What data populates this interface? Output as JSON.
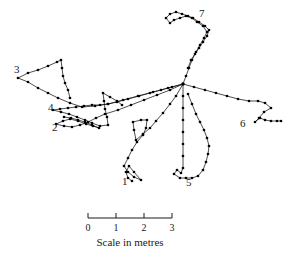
{
  "figure": {
    "background_color": "#ffffff",
    "line_color": "#111111",
    "node_color": "#000000",
    "hub": {
      "label": "central-nest-hub",
      "x": 183,
      "y": 84
    }
  },
  "scale_bar": {
    "caption": "Scale in metres",
    "ticks": [
      {
        "label": "0",
        "x": 88
      },
      {
        "label": "1",
        "x": 116
      },
      {
        "label": "2",
        "x": 144
      },
      {
        "label": "3",
        "x": 172
      }
    ],
    "bar_y": 218,
    "tick_height": 5,
    "numbers_y": 231,
    "caption_y": 246,
    "unit": "metres",
    "length_units": 3
  },
  "branches": [
    {
      "id": "1",
      "label": "1",
      "label_x": 122,
      "label_y": 185,
      "points": [
        [
          183,
          84
        ],
        [
          176,
          96
        ],
        [
          170,
          104
        ],
        [
          163,
          113
        ],
        [
          156,
          121
        ],
        [
          150,
          128
        ],
        [
          143,
          134
        ],
        [
          136,
          140
        ],
        [
          134,
          130
        ],
        [
          133,
          122
        ],
        [
          141,
          120
        ],
        [
          147,
          120
        ],
        [
          146,
          128
        ],
        [
          143,
          135
        ],
        [
          137,
          142
        ],
        [
          132,
          150
        ],
        [
          128,
          158
        ],
        [
          124,
          166
        ],
        [
          128,
          172
        ],
        [
          134,
          177
        ],
        [
          141,
          180
        ],
        [
          134,
          172
        ],
        [
          129,
          166
        ],
        [
          126,
          172
        ],
        [
          128,
          178
        ],
        [
          132,
          181
        ]
      ]
    },
    {
      "id": "2",
      "label": "2",
      "label_x": 52,
      "label_y": 131,
      "points": [
        [
          183,
          84
        ],
        [
          170,
          90
        ],
        [
          157,
          95
        ],
        [
          144,
          100
        ],
        [
          131,
          105
        ],
        [
          118,
          110
        ],
        [
          105,
          114
        ],
        [
          96,
          118
        ],
        [
          88,
          122
        ],
        [
          80,
          125
        ],
        [
          72,
          127
        ],
        [
          64,
          126
        ],
        [
          56,
          124
        ],
        [
          63,
          121
        ],
        [
          70,
          119
        ],
        [
          78,
          121
        ],
        [
          86,
          124
        ],
        [
          93,
          126
        ],
        [
          99,
          128
        ],
        [
          92,
          125
        ],
        [
          85,
          122
        ],
        [
          78,
          120
        ],
        [
          71,
          118
        ],
        [
          64,
          117
        ]
      ]
    },
    {
      "id": "3",
      "label": "3",
      "label_x": 14,
      "label_y": 73,
      "points": [
        [
          183,
          84
        ],
        [
          168,
          88
        ],
        [
          153,
          92
        ],
        [
          138,
          96
        ],
        [
          123,
          100
        ],
        [
          108,
          104
        ],
        [
          95,
          106
        ],
        [
          82,
          107
        ],
        [
          70,
          103
        ],
        [
          58,
          98
        ],
        [
          48,
          93
        ],
        [
          38,
          88
        ],
        [
          28,
          82
        ],
        [
          18,
          78
        ],
        [
          28,
          73
        ],
        [
          38,
          70
        ],
        [
          48,
          66
        ],
        [
          57,
          62
        ],
        [
          61,
          60
        ],
        [
          62,
          68
        ],
        [
          63,
          76
        ],
        [
          65,
          83
        ],
        [
          68,
          90
        ],
        [
          70,
          98
        ]
      ]
    },
    {
      "id": "4",
      "label": "4",
      "label_x": 48,
      "label_y": 111,
      "points": [
        [
          183,
          84
        ],
        [
          172,
          87
        ],
        [
          161,
          90
        ],
        [
          150,
          93
        ],
        [
          139,
          96
        ],
        [
          128,
          99
        ],
        [
          117,
          102
        ],
        [
          108,
          104
        ],
        [
          100,
          105
        ],
        [
          92,
          105
        ],
        [
          84,
          106
        ],
        [
          76,
          107
        ],
        [
          68,
          108
        ],
        [
          60,
          109
        ],
        [
          53,
          110
        ],
        [
          61,
          112
        ],
        [
          69,
          114
        ],
        [
          77,
          117
        ],
        [
          85,
          120
        ],
        [
          92,
          123
        ],
        [
          100,
          126
        ],
        [
          108,
          125
        ],
        [
          107,
          117
        ],
        [
          105,
          109
        ],
        [
          104,
          101
        ],
        [
          103,
          93
        ],
        [
          110,
          97
        ],
        [
          117,
          101
        ],
        [
          122,
          105
        ]
      ]
    },
    {
      "id": "5",
      "label": "5",
      "label_x": 186,
      "label_y": 186,
      "points": [
        [
          183,
          84
        ],
        [
          183,
          96
        ],
        [
          183,
          108
        ],
        [
          183,
          120
        ],
        [
          183,
          132
        ],
        [
          183,
          144
        ],
        [
          183,
          156
        ],
        [
          183,
          168
        ],
        [
          181,
          173
        ],
        [
          177,
          170
        ],
        [
          174,
          174
        ],
        [
          180,
          178
        ],
        [
          186,
          178
        ],
        [
          192,
          178
        ],
        [
          198,
          176
        ],
        [
          203,
          170
        ],
        [
          206,
          162
        ],
        [
          208,
          154
        ],
        [
          209,
          146
        ],
        [
          207,
          138
        ],
        [
          204,
          130
        ],
        [
          200,
          122
        ],
        [
          196,
          114
        ],
        [
          192,
          104
        ],
        [
          188,
          94
        ]
      ]
    },
    {
      "id": "6",
      "label": "6",
      "label_x": 240,
      "label_y": 127,
      "points": [
        [
          183,
          84
        ],
        [
          194,
          87
        ],
        [
          205,
          90
        ],
        [
          216,
          93
        ],
        [
          227,
          96
        ],
        [
          238,
          99
        ],
        [
          249,
          101
        ],
        [
          258,
          101
        ],
        [
          265,
          103
        ],
        [
          271,
          108
        ],
        [
          264,
          112
        ],
        [
          259,
          118
        ],
        [
          255,
          122
        ],
        [
          260,
          118
        ],
        [
          265,
          120
        ],
        [
          271,
          121
        ],
        [
          277,
          121
        ],
        [
          281,
          121
        ]
      ]
    },
    {
      "id": "7",
      "label": "7",
      "label_x": 199,
      "label_y": 17,
      "points": [
        [
          183,
          84
        ],
        [
          186,
          76
        ],
        [
          189,
          68
        ],
        [
          192,
          60
        ],
        [
          196,
          52
        ],
        [
          200,
          45
        ],
        [
          204,
          38
        ],
        [
          207,
          32
        ],
        [
          203,
          26
        ],
        [
          197,
          22
        ],
        [
          192,
          18
        ],
        [
          186,
          16
        ],
        [
          180,
          18
        ],
        [
          174,
          20
        ],
        [
          170,
          23
        ],
        [
          166,
          18
        ],
        [
          170,
          14
        ],
        [
          176,
          12
        ],
        [
          182,
          14
        ],
        [
          188,
          16
        ],
        [
          193,
          18
        ],
        [
          199,
          22
        ],
        [
          205,
          26
        ],
        [
          209,
          30
        ],
        [
          207,
          36
        ],
        [
          203,
          42
        ],
        [
          199,
          48
        ],
        [
          195,
          54
        ],
        [
          191,
          60
        ],
        [
          188,
          68
        ]
      ]
    }
  ]
}
